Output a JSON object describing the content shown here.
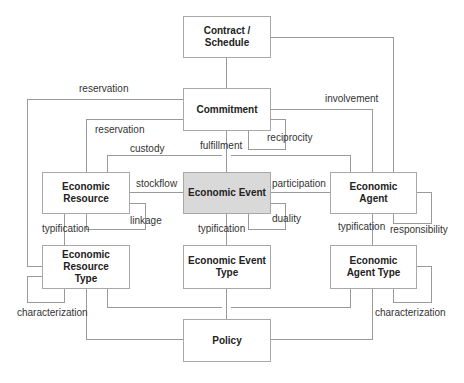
{
  "diagram": {
    "entities": {
      "contract_schedule": "Contract /\nSchedule",
      "commitment": "Commitment",
      "economic_resource": "Economic\nResource",
      "economic_event": "Economic Event",
      "economic_agent": "Economic\nAgent",
      "economic_resource_type": "Economic\nResource\nType",
      "economic_event_type": "Economic Event\nType",
      "economic_agent_type": "Economic\nAgent Type",
      "policy": "Policy"
    },
    "highlight_color": "#d9d9d9",
    "relations": {
      "reservation_outer": "reservation",
      "reservation_inner": "reservation",
      "involvement": "involvement",
      "reciprocity": "reciprocity",
      "fulfillment": "fulfillment",
      "custody": "custody",
      "stockflow": "stockflow",
      "participation": "participation",
      "linkage": "linkage",
      "duality": "duality",
      "typification_resource": "typification",
      "typification_event": "typification",
      "typification_agent": "typification",
      "responsibility": "responsibility",
      "characterization_resource_self": "characterization",
      "characterization_resource_policy": "characterization",
      "characterization_agent_self": "characterization"
    }
  }
}
